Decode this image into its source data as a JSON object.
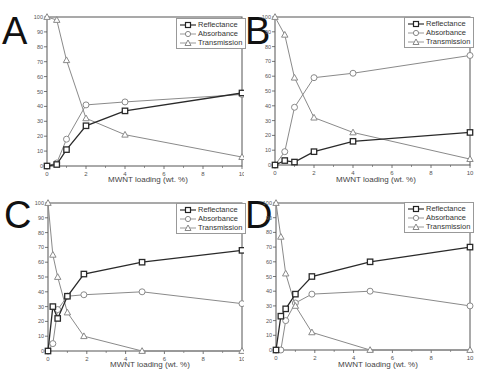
{
  "figure": {
    "xlabel": "MWNT loading (wt. %)",
    "legend": [
      "Reflectance",
      "Absorbance",
      "Transmission"
    ]
  },
  "chart_data": [
    {
      "panel": "A",
      "type": "line",
      "xlabel": "MWNT loading (wt. %)",
      "ylabel": "",
      "xlim": [
        0,
        10
      ],
      "ylim": [
        0,
        100
      ],
      "xticks": [
        0,
        2,
        4,
        6,
        8,
        10
      ],
      "yticks": [
        0,
        10,
        20,
        30,
        40,
        50,
        60,
        70,
        80,
        90,
        100
      ],
      "legend_position": "top-right",
      "series": [
        {
          "name": "Reflectance",
          "marker": "square",
          "x": [
            0,
            0.5,
            1,
            2,
            4,
            10
          ],
          "values": [
            0,
            1,
            11,
            27,
            37,
            49
          ]
        },
        {
          "name": "Absorbance",
          "marker": "circle",
          "x": [
            0,
            0.5,
            1,
            2,
            4,
            10
          ],
          "values": [
            0,
            2,
            18,
            41,
            43,
            48
          ]
        },
        {
          "name": "Transmission",
          "marker": "triangle",
          "x": [
            0,
            0.5,
            1,
            2,
            4,
            10
          ],
          "values": [
            100,
            98,
            71,
            32,
            21,
            6
          ]
        }
      ]
    },
    {
      "panel": "B",
      "type": "line",
      "xlabel": "MWNT loading (wt. %)",
      "ylabel": "",
      "xlim": [
        0,
        10
      ],
      "ylim": [
        0,
        100
      ],
      "xticks": [
        0,
        2,
        4,
        6,
        8,
        10
      ],
      "yticks": [
        0,
        10,
        20,
        30,
        40,
        50,
        60,
        70,
        80,
        90,
        100
      ],
      "legend_position": "top-right",
      "series": [
        {
          "name": "Reflectance",
          "marker": "square",
          "x": [
            0,
            0.5,
            1,
            2,
            4,
            10
          ],
          "values": [
            0,
            3,
            2,
            9,
            16,
            22
          ]
        },
        {
          "name": "Absorbance",
          "marker": "circle",
          "x": [
            0,
            0.5,
            1,
            2,
            4,
            10
          ],
          "values": [
            0,
            9,
            39,
            59,
            62,
            74
          ]
        },
        {
          "name": "Transmission",
          "marker": "triangle",
          "x": [
            0,
            0.5,
            1,
            2,
            4,
            10
          ],
          "values": [
            100,
            88,
            59,
            32,
            22,
            4
          ]
        }
      ]
    },
    {
      "panel": "C",
      "type": "line",
      "xlabel": "MWNT loading (wt. %)",
      "ylabel": "",
      "xlim": [
        0,
        10
      ],
      "ylim": [
        0,
        100
      ],
      "xticks": [
        0,
        2,
        4,
        6,
        8,
        10
      ],
      "yticks": [
        0,
        10,
        20,
        30,
        40,
        50,
        60,
        70,
        80,
        90,
        100
      ],
      "legend_position": "top-right",
      "series": [
        {
          "name": "Reflectance",
          "marker": "square",
          "x": [
            0,
            0.25,
            0.5,
            1,
            1.85,
            4.85,
            10
          ],
          "values": [
            0,
            30,
            22,
            37,
            52,
            60,
            68
          ]
        },
        {
          "name": "Absorbance",
          "marker": "circle",
          "x": [
            0,
            0.25,
            0.5,
            1,
            1.85,
            4.85,
            10
          ],
          "values": [
            0,
            5,
            28,
            37,
            38,
            40,
            32
          ]
        },
        {
          "name": "Transmission",
          "marker": "triangle",
          "x": [
            0,
            0.25,
            0.5,
            1,
            1.85,
            4.85,
            10
          ],
          "values": [
            100,
            65,
            50,
            26,
            10,
            0,
            0
          ]
        }
      ]
    },
    {
      "panel": "D",
      "type": "line",
      "xlabel": "MWNT loading (wt. %)",
      "ylabel": "",
      "xlim": [
        0,
        10
      ],
      "ylim": [
        0,
        100
      ],
      "xticks": [
        0,
        2,
        4,
        6,
        8,
        10
      ],
      "yticks": [
        0,
        10,
        20,
        30,
        40,
        50,
        60,
        70,
        80,
        90,
        100
      ],
      "legend_position": "top-right",
      "series": [
        {
          "name": "Reflectance",
          "marker": "square",
          "x": [
            0,
            0.25,
            0.5,
            1,
            1.85,
            4.85,
            10
          ],
          "values": [
            0,
            23,
            28,
            38,
            50,
            60,
            70
          ]
        },
        {
          "name": "Absorbance",
          "marker": "circle",
          "x": [
            0,
            0.25,
            0.5,
            1,
            1.85,
            4.85,
            10
          ],
          "values": [
            0,
            0,
            20,
            32,
            38,
            40,
            30
          ]
        },
        {
          "name": "Transmission",
          "marker": "triangle",
          "x": [
            0,
            0.25,
            0.5,
            1,
            1.85,
            4.85,
            10
          ],
          "values": [
            100,
            77,
            52,
            30,
            12,
            0,
            0
          ]
        }
      ]
    }
  ]
}
